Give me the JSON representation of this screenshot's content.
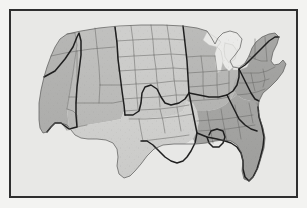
{
  "figure": {
    "title": "Map of the contiguous United States",
    "frame_color": "#2e2e2e",
    "page_background": "#f3f3f1",
    "map_background": "#e8e8e6",
    "state_border_color": "#6b6b69",
    "region_border_color": "#1f1f1f",
    "water_color": "#ececea",
    "projection_note": "contiguous 48 states"
  },
  "legend": {
    "region_shades": [
      {
        "name": "west",
        "label": "West",
        "color": "#adadab"
      },
      {
        "name": "mountain",
        "label": "Mountain",
        "color": "#b6b6b4"
      },
      {
        "name": "plains",
        "label": "Plains",
        "color": "#c8c8c6"
      },
      {
        "name": "texas-south-central",
        "label": "South Central",
        "color": "#cfcfcd"
      },
      {
        "name": "midwest",
        "label": "Midwest",
        "color": "#b0b0ae"
      },
      {
        "name": "southeast",
        "label": "Southeast",
        "color": "#a0a09e"
      },
      {
        "name": "northeast",
        "label": "Northeast",
        "color": "#9a9a98"
      }
    ]
  },
  "regions": [
    {
      "name": "pacific-northwest-california",
      "label": "Pacific",
      "shade": "#adadab",
      "bold_outline": true
    },
    {
      "name": "mountain-west",
      "label": "Mountain",
      "shade": "#b8b8b6",
      "bold_outline": true
    },
    {
      "name": "great-plains",
      "label": "Plains",
      "shade": "#c8c8c6",
      "bold_outline": true
    },
    {
      "name": "south-central",
      "label": "South Central",
      "shade": "#d0d0ce",
      "bold_outline": true
    },
    {
      "name": "great-lakes-midwest",
      "label": "Midwest",
      "shade": "#b2b2b0",
      "bold_outline": true
    },
    {
      "name": "southeast",
      "label": "Southeast",
      "shade": "#a2a2a0",
      "bold_outline": true
    },
    {
      "name": "northeast",
      "label": "Northeast",
      "shade": "#9c9c9a",
      "bold_outline": true
    }
  ],
  "features": {
    "great_lakes": "Great Lakes",
    "florida_peninsula": "Florida",
    "michigan_peninsula": "Michigan",
    "gulf_coast": "Gulf Coast",
    "atlantic_coast": "Atlantic Coast",
    "pacific_coast": "Pacific Coast",
    "canada_border": "Northern border",
    "mexico_border": "Southern border"
  },
  "texture": {
    "speckle": "stippled dot shading",
    "dot_color": "#7a7a78"
  }
}
